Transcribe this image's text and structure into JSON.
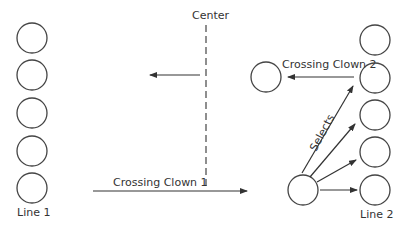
{
  "diagram": {
    "center_label": "Center",
    "line1_label": "Line 1",
    "line2_label": "Line 2",
    "crossing1_label": "Crossing Clown 1",
    "crossing2_label": "Crossing Clown 2",
    "selects_label": "Selects",
    "stroke_color": "#333333",
    "line1_count": 5,
    "line2_count": 5
  }
}
